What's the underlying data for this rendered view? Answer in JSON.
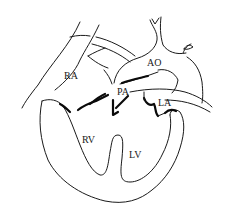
{
  "diagram": {
    "labels": {
      "ra": "RA",
      "ao": "AO",
      "pa": "PA",
      "la": "LA",
      "rv": "RV",
      "lv": "LV"
    }
  },
  "colors": {
    "background": "#ffffff",
    "stroke": "#1a1a1a"
  }
}
